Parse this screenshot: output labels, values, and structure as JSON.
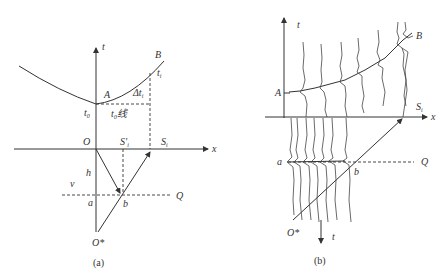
{
  "panel_a": {
    "caption": "(a)",
    "labels": {
      "t_axis": "t",
      "x_axis": "x",
      "B": "B",
      "ti": "t",
      "ti_sub": "i",
      "A": "A",
      "delta_t": "Δt",
      "delta_t_sub": "i",
      "t0": "t",
      "t0_sub": "0",
      "t0_line": "t₀线",
      "O": "O",
      "Si_prime": "S′",
      "Si_prime_sub": "i",
      "Si": "S",
      "Si_sub": "i",
      "h": "h",
      "v": "v",
      "a": "a",
      "b": "b",
      "Q": "Q",
      "O_star": "O*"
    }
  },
  "panel_b": {
    "caption": "(b)",
    "labels": {
      "t_axis_top": "t",
      "B": "B",
      "A": "A",
      "Si": "S",
      "Si_sub": "i",
      "x_axis": "x",
      "a": "a",
      "b": "b",
      "Q": "Q",
      "O_star": "O*",
      "t_axis_bottom": "t"
    }
  }
}
